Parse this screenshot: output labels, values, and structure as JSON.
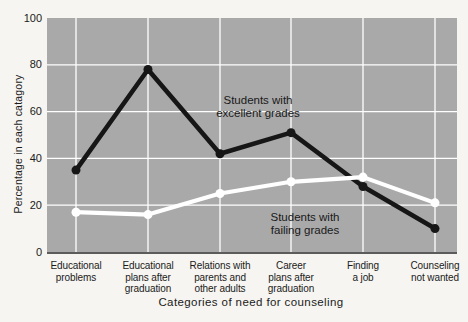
{
  "figure": {
    "page_bg": "#f6f5f1",
    "text_color": "#1b1b1b"
  },
  "chart_data": {
    "type": "line",
    "title": "",
    "xlabel": "Categories of need for counseling",
    "ylabel": "Percentage in each catagory",
    "categories": [
      "Educational\nproblems",
      "Educational\nplans after\ngraduation",
      "Relations with\nparents and\nother adults",
      "Career\nplans after\ngraduation",
      "Finding\na job",
      "Counseling\nnot wanted"
    ],
    "series": [
      {
        "name": "Students with\nexcellent grades",
        "color": "#161616",
        "values": [
          35,
          78,
          42,
          51,
          28,
          10
        ]
      },
      {
        "name": "Students with\nfailing grades",
        "color": "#ffffff",
        "values": [
          17,
          16,
          25,
          30,
          32,
          21
        ]
      }
    ],
    "ylim": [
      0,
      100
    ],
    "yticks": [
      0,
      20,
      40,
      60,
      80,
      100
    ],
    "grid": true,
    "legend_position": "inline-annotations",
    "plot_bg": "#a9a9a9",
    "grid_color": "#ffffff"
  }
}
